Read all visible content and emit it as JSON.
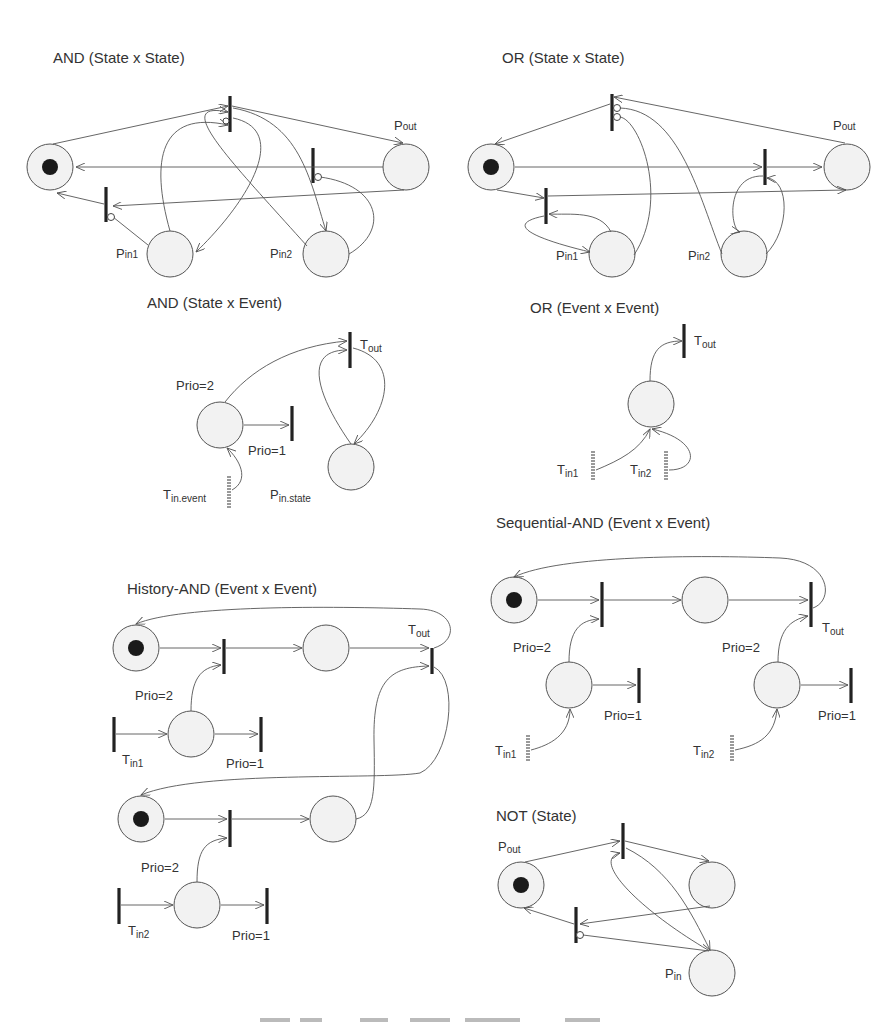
{
  "figure": {
    "panels": [
      {
        "id": "and-state-state",
        "title": "AND (State x State)",
        "labels": {
          "p_out": "P",
          "p_out_sub": "out",
          "p_in1": "P",
          "p_in1_sub": "in1",
          "p_in2": "P",
          "p_in2_sub": "in2"
        }
      },
      {
        "id": "or-state-state",
        "title": "OR (State x State)",
        "labels": {
          "p_out": "P",
          "p_out_sub": "out",
          "p_in1": "P",
          "p_in1_sub": "in1",
          "p_in2": "P",
          "p_in2_sub": "in2"
        }
      },
      {
        "id": "and-state-event",
        "title": "AND (State x Event)",
        "labels": {
          "t_out": "T",
          "t_out_sub": "out",
          "prio2": "Prio=2",
          "prio1": "Prio=1",
          "t_in_event": "T",
          "t_in_event_sub": "in.event",
          "p_in_state": "P",
          "p_in_state_sub": "in.state"
        }
      },
      {
        "id": "or-event-event",
        "title": "OR (Event x Event)",
        "labels": {
          "t_out": "T",
          "t_out_sub": "out",
          "t_in1": "T",
          "t_in1_sub": "in1",
          "t_in2": "T",
          "t_in2_sub": "in2"
        }
      },
      {
        "id": "sequential-and-event-event",
        "title": "Sequential-AND (Event x Event)",
        "labels": {
          "t_out": "T",
          "t_out_sub": "out",
          "prio2a": "Prio=2",
          "prio1a": "Prio=1",
          "prio2b": "Prio=2",
          "prio1b": "Prio=1",
          "t_in1": "T",
          "t_in1_sub": "in1",
          "t_in2": "T",
          "t_in2_sub": "in2"
        }
      },
      {
        "id": "history-and-event-event",
        "title": "History-AND (Event x Event)",
        "labels": {
          "t_out": "T",
          "t_out_sub": "out",
          "prio2a": "Prio=2",
          "prio1a": "Prio=1",
          "prio2b": "Prio=2",
          "prio1b": "Prio=1",
          "t_in1": "T",
          "t_in1_sub": "in1",
          "t_in2": "T",
          "t_in2_sub": "in2"
        }
      },
      {
        "id": "not-state",
        "title": "NOT (State)",
        "labels": {
          "p_out": "P",
          "p_out_sub": "out",
          "p_in": "P",
          "p_in_sub": "in"
        }
      }
    ]
  }
}
